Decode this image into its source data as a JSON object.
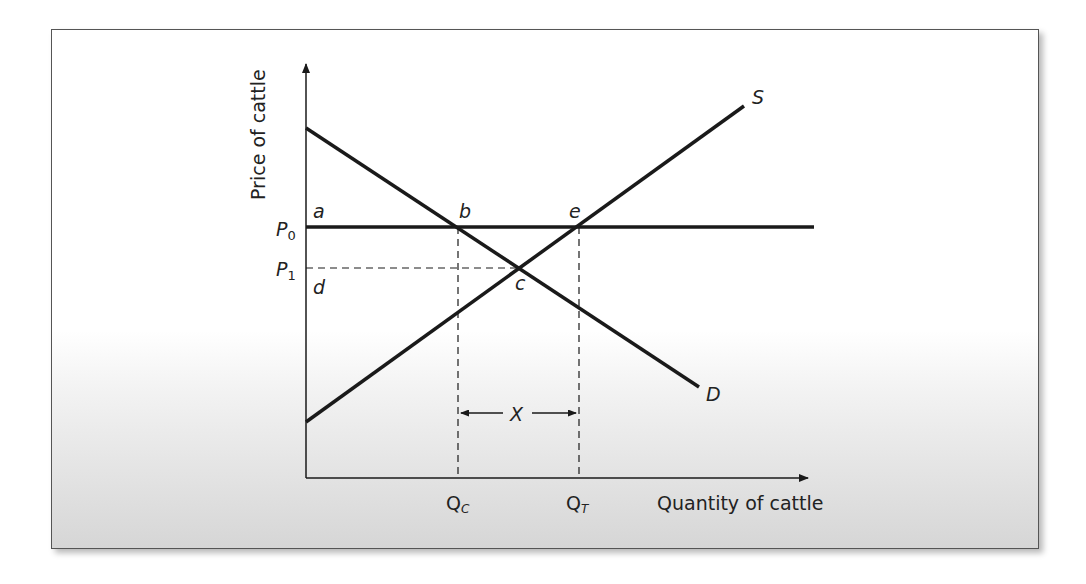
{
  "diagram": {
    "type": "supply-demand",
    "y_axis_label": "Price of cattle",
    "x_axis_label": "Quantity of cattle",
    "price_labels": {
      "p0": "P",
      "p0_sub": "0",
      "p1": "P",
      "p1_sub": "1"
    },
    "quantity_labels": {
      "qc": "Q",
      "qc_sub": "C",
      "qt": "Q",
      "qt_sub": "T"
    },
    "curve_labels": {
      "supply": "S",
      "demand": "D"
    },
    "point_labels": {
      "a": "a",
      "b": "b",
      "c": "c",
      "d": "d",
      "e": "e"
    },
    "gap_label": "X",
    "colors": {
      "line": "#1a1a1a",
      "frame_border": "#555555",
      "gradient_bottom": "#d6d6d6"
    }
  }
}
